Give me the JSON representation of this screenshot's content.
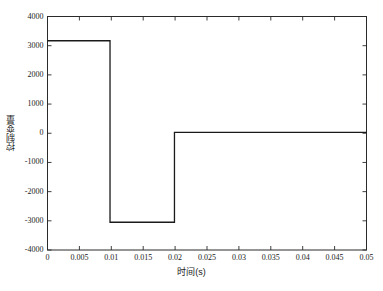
{
  "chart_data": {
    "type": "line",
    "title": "",
    "xlabel": "时间(s)",
    "ylabel": "控制变量",
    "xlim": [
      0,
      0.05
    ],
    "ylim": [
      -4000,
      4000
    ],
    "grid": false,
    "legend": null,
    "legend_position": "none",
    "line_color": "#1a1a1a",
    "frame_color": "#1a1a1a",
    "background_color": "#ffffff",
    "xticks": [
      0,
      0.005,
      0.01,
      0.015,
      0.02,
      0.025,
      0.03,
      0.035,
      0.04,
      0.045,
      0.05
    ],
    "xtick_labels": [
      "0",
      "0.005",
      "0.01",
      "0.015",
      "0.02",
      "0.025",
      "0.03",
      "0.035",
      "0.04",
      "0.045",
      "0.05"
    ],
    "yticks": [
      4000,
      3000,
      2000,
      1000,
      0,
      -1000,
      -2000,
      -3000,
      -4000
    ],
    "ytick_labels": [
      "4000",
      "3000",
      "2000",
      "1000",
      "0",
      "-1000",
      "-2000",
      "-3000",
      "-4000"
    ],
    "series": [
      {
        "name": "控制变量",
        "x": [
          0,
          0.0098,
          0.0098,
          0.0199,
          0.0199,
          0.05
        ],
        "y": [
          3170,
          3170,
          -3050,
          -3050,
          30,
          30
        ]
      }
    ],
    "segments": [
      {
        "label": "上阶跃",
        "x_start": 0,
        "x_end": 0.0098,
        "value": 3170
      },
      {
        "label": "下阶跃",
        "x_start": 0.0098,
        "x_end": 0.0199,
        "value": -3050
      },
      {
        "label": "稳态",
        "x_start": 0.0199,
        "x_end": 0.05,
        "value": 30
      }
    ]
  }
}
